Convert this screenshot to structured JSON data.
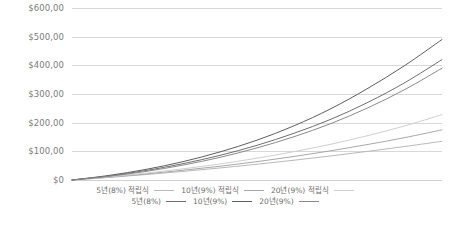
{
  "chart_data": {
    "type": "line",
    "title": "",
    "xlabel": "",
    "ylabel": "",
    "ylim": [
      0,
      600
    ],
    "xlim": [
      0,
      20
    ],
    "grid": true,
    "legend_position": "bottom",
    "y_ticks": [
      {
        "value": 600,
        "label": "$600,00"
      },
      {
        "value": 500,
        "label": "$500,00"
      },
      {
        "value": 400,
        "label": "$400,00"
      },
      {
        "value": 300,
        "label": "$300,00"
      },
      {
        "value": 200,
        "label": "$200,00"
      },
      {
        "value": 100,
        "label": "$100,00"
      },
      {
        "value": 0,
        "label": "$0"
      }
    ],
    "x": [
      0,
      2,
      4,
      6,
      8,
      10,
      12,
      14,
      16,
      18,
      20
    ],
    "series": [
      {
        "name": "5년(8%) 적립식",
        "color": "#b9b9b9",
        "values": [
          0,
          9,
          19,
          30,
          42,
          55,
          69,
          84,
          100,
          117,
          135
        ]
      },
      {
        "name": "10년(9%) 적립식",
        "color": "#a8a8a8",
        "values": [
          0,
          10,
          21,
          34,
          48,
          64,
          82,
          102,
          124,
          148,
          175
        ]
      },
      {
        "name": "20년(9%) 적립식",
        "color": "#cfcfcf",
        "values": [
          0,
          11,
          24,
          39,
          56,
          76,
          99,
          125,
          155,
          189,
          228
        ]
      },
      {
        "name": "5년(8%)",
        "color": "#6f6f6f",
        "values": [
          0,
          14,
          33,
          57,
          86,
          121,
          163,
          212,
          271,
          340,
          420
        ]
      },
      {
        "name": "10년(9%)",
        "color": "#5e5e5e",
        "values": [
          0,
          16,
          37,
          64,
          98,
          139,
          189,
          249,
          320,
          400,
          490
        ]
      },
      {
        "name": "20년(9%)",
        "color": "#8a8a8a",
        "values": [
          0,
          13,
          30,
          52,
          79,
          112,
          151,
          197,
          252,
          316,
          390
        ]
      }
    ]
  },
  "legend": {
    "rows": [
      {
        "items": [
          {
            "label": "5년(8%) 적립식",
            "color": "#b9b9b9"
          },
          {
            "label": "10년(9%) 적립식",
            "color": "#a8a8a8"
          },
          {
            "label": "20년(9%) 적립식",
            "color": "#cfcfcf"
          }
        ]
      },
      {
        "items": [
          {
            "label": "5년(8%)",
            "color": "#6f6f6f"
          },
          {
            "label": "10년(9%)",
            "color": "#5e5e5e"
          },
          {
            "label": "20년(9%)",
            "color": "#8a8a8a"
          }
        ]
      }
    ]
  },
  "colors": {
    "gridline": "#d8d8d8",
    "tick_text": "#7b7b7b",
    "legend_text": "#6e6e6e",
    "background": "#ffffff"
  }
}
